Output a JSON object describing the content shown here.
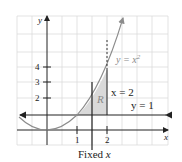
{
  "diagram": {
    "type": "region-between-curves",
    "curve_label": "y = x",
    "curve_exponent": "2",
    "vertical_line_label": "x = 2",
    "horizontal_line_label": "y = 1",
    "region_label": "R",
    "slice_label": "Fixed ",
    "slice_var": "x",
    "axis_x_label": "x",
    "axis_y_label": "y",
    "x_ticks": [
      "1",
      "2"
    ],
    "y_ticks": [
      "2",
      "3",
      "4"
    ],
    "colors": {
      "curve": "#8c8c8c",
      "region_fill": "#d9d9d9",
      "axis": "#222222",
      "grid": "#dcdcdc"
    }
  }
}
